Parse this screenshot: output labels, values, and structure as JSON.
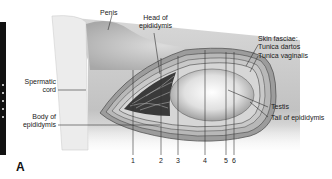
{
  "figure": {
    "panel_label": "A",
    "labels": {
      "penis": "Penis",
      "head_of_epididymis": [
        "Head of",
        "epididymis"
      ],
      "spermatic_cord": [
        "Spermatic",
        "cord"
      ],
      "body_of_epididymis": [
        "Body of",
        "epididymis"
      ],
      "skin_fasciae": "Skin fasciae:",
      "tunica_dartos": "Tunica dartos",
      "tunica_vaginalis": "Tunica vaginalis",
      "testis": "Testis",
      "tail_of_epididymis": "Tail of epididymis"
    },
    "layer_numbers": [
      "1",
      "2",
      "3",
      "4",
      "5",
      "6"
    ]
  }
}
